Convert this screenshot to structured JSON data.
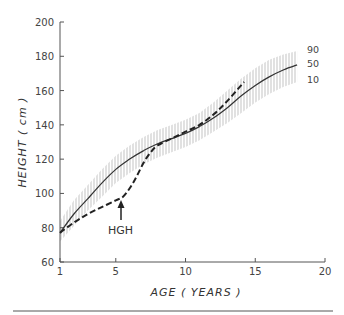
{
  "chart_data": {
    "type": "line",
    "title": "",
    "xlabel": "AGE ( YEARS )",
    "ylabel": "HEIGHT ( cm )",
    "xlim": [
      1,
      20
    ],
    "ylim": [
      60,
      200
    ],
    "x_ticks": [
      1,
      5,
      10,
      15,
      20
    ],
    "y_ticks": [
      60,
      80,
      100,
      120,
      140,
      160,
      180,
      200
    ],
    "grid": false,
    "legend": "none",
    "percentile_labels": [
      "90",
      "50",
      "10"
    ],
    "series": [
      {
        "name": "Normal height 50th percentile",
        "style": "solid",
        "x": [
          1,
          2,
          3,
          4,
          5,
          6,
          7,
          8,
          9,
          10,
          11,
          12,
          13,
          14,
          15,
          16,
          17,
          18
        ],
        "values": [
          77,
          88,
          97,
          106,
          114,
          120,
          125,
          129,
          132,
          135,
          139,
          144,
          150,
          157,
          163,
          168,
          172,
          175
        ]
      },
      {
        "name": "Normal height 90th percentile",
        "style": "hatched-band-upper",
        "x": [
          1,
          2,
          3,
          4,
          5,
          6,
          7,
          8,
          9,
          10,
          11,
          12,
          13,
          14,
          15,
          16,
          17,
          18
        ],
        "values": [
          84,
          96,
          105,
          114,
          122,
          128,
          133,
          137,
          140,
          143,
          147,
          153,
          160,
          167,
          173,
          178,
          181,
          183
        ]
      },
      {
        "name": "Normal height 10th percentile",
        "style": "hatched-band-lower",
        "x": [
          1,
          2,
          3,
          4,
          5,
          6,
          7,
          8,
          9,
          10,
          11,
          12,
          13,
          14,
          15,
          16,
          17,
          18
        ],
        "values": [
          72,
          81,
          90,
          98,
          106,
          112,
          117,
          121,
          124,
          127,
          131,
          136,
          141,
          147,
          153,
          158,
          162,
          165
        ]
      },
      {
        "name": "Treated patient",
        "style": "dashed",
        "x": [
          1,
          2,
          3,
          4,
          5,
          5.5,
          6,
          6.5,
          7,
          7.5,
          8,
          9,
          10,
          11,
          12,
          13,
          14.2
        ],
        "values": [
          77,
          83,
          88,
          92,
          96,
          98,
          103,
          110,
          118,
          124,
          128,
          132,
          136,
          140,
          146,
          154,
          165
        ]
      }
    ],
    "annotations": [
      {
        "text": "HGH",
        "x": 5.5,
        "y": 85,
        "arrow_to": {
          "x": 5.5,
          "y": 97
        }
      }
    ]
  },
  "labels": {
    "ylabel": "HEIGHT ( cm )",
    "xlabel": "AGE ( YEARS )",
    "hgh": "HGH",
    "p90": "90",
    "p50": "50",
    "p10": "10",
    "x_ticks": [
      "1",
      "5",
      "10",
      "15",
      "20"
    ],
    "y_ticks": [
      "60",
      "80",
      "100",
      "120",
      "140",
      "160",
      "180",
      "200"
    ]
  }
}
